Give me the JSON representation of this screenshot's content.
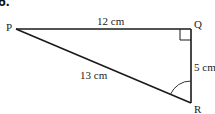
{
  "question_number": "6.",
  "triangle": {
    "vertices": {
      "P": {
        "label": "P"
      },
      "Q": {
        "label": "Q"
      },
      "R": {
        "label": "R"
      }
    },
    "sides": {
      "PQ": {
        "label": "12 cm"
      },
      "QR": {
        "label": "5 cm"
      },
      "PR": {
        "label": "13 cm"
      }
    },
    "right_angle_at": "Q",
    "marked_angle_at": "R"
  },
  "colors": {
    "line": "#1a1a1a",
    "text": "#222222",
    "background": "#ffffff"
  }
}
